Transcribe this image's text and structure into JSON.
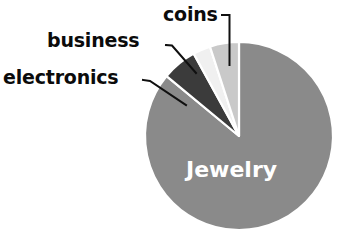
{
  "chart_data": {
    "type": "pie",
    "title": "",
    "subtitle": "",
    "xlabel": "",
    "ylabel": "",
    "grid": false,
    "legend_position": "none",
    "label_style": "external-with-leader-lines",
    "start_angle_deg": 0,
    "direction": "clockwise",
    "categories": [
      "Jewelry",
      "coins",
      "business",
      "electronics"
    ],
    "values": [
      86,
      6,
      3,
      5
    ],
    "units": "percent",
    "slices": [
      {
        "label": "Jewelry",
        "value": 86,
        "color": "#8a8a8a",
        "start_angle_deg": 0,
        "end_angle_deg": 309.6,
        "label_placement": "inside",
        "label_color": "#ffffff"
      },
      {
        "label": "coins",
        "value": 6,
        "color": "#3b3b3b",
        "start_angle_deg": 309.6,
        "end_angle_deg": 331.2,
        "label_placement": "outside",
        "label_color": "#0b0b0b",
        "leader": "vertical"
      },
      {
        "label": "business",
        "value": 3,
        "color": "#f0f0f0",
        "start_angle_deg": 331.2,
        "end_angle_deg": 342.0,
        "label_placement": "outside",
        "label_color": "#0b0b0b",
        "leader": "diagonal"
      },
      {
        "label": "electronics",
        "value": 5,
        "color": "#c9c9c9",
        "start_angle_deg": 342.0,
        "end_angle_deg": 360.0,
        "label_placement": "outside",
        "label_color": "#0b0b0b",
        "leader": "diagonal"
      }
    ]
  },
  "labels": {
    "coins": "coins",
    "business": "business",
    "electronics": "electronics",
    "jewelry": "Jewelry"
  },
  "colors": {
    "background": "#ffffff",
    "jewelry": "#8a8a8a",
    "coins": "#3b3b3b",
    "business": "#f0f0f0",
    "electronics": "#c9c9c9",
    "slice_border": "#ffffff",
    "leader_line": "#101010",
    "label_text": "#0b0b0b",
    "inner_label_text": "#ffffff"
  }
}
